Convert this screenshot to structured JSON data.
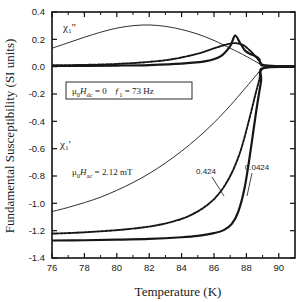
{
  "chart_data": {
    "type": "line",
    "title": "",
    "xlabel": "Temperature (K)",
    "ylabel": "Fundamental Susceptibility (SI units)",
    "xlim": [
      76,
      91
    ],
    "ylim": [
      -1.4,
      0.4
    ],
    "xticks": [
      76,
      78,
      80,
      82,
      84,
      86,
      88,
      90
    ],
    "xticklabels": [
      "76",
      "78",
      "80",
      "82",
      "84",
      "86",
      "88",
      "90"
    ],
    "yticks": [
      -1.4,
      -1.2,
      -1.0,
      -0.8,
      -0.6,
      -0.4,
      -0.2,
      0.0,
      0.2,
      0.4
    ],
    "yticklabels": [
      "-1.4",
      "-1.2",
      "-1.0",
      "-0.8",
      "-0.6",
      "-0.4",
      "-0.2",
      "0.0",
      "0.2",
      "0.4"
    ],
    "grid": false,
    "legend": "none",
    "series": [
      {
        "name": "chi1-imag-thin",
        "quantity": "chi_1''",
        "style": "thin-solid",
        "x": [
          76,
          77,
          78,
          79,
          80,
          81,
          82,
          83,
          84,
          85,
          86,
          87,
          87.6,
          88.2,
          88.6,
          88.9,
          89.1,
          91
        ],
        "y": [
          0.135,
          0.175,
          0.215,
          0.252,
          0.282,
          0.3,
          0.305,
          0.295,
          0.272,
          0.238,
          0.192,
          0.135,
          0.1,
          0.062,
          0.035,
          0.014,
          0.004,
          0.002
        ]
      },
      {
        "name": "chi1-imag-dashed",
        "quantity": "chi_1''",
        "style": "dashed",
        "x": [
          76,
          78,
          80,
          82,
          83.5,
          85,
          86,
          86.8,
          87.3,
          87.8,
          88.2,
          88.6,
          88.9,
          89.1,
          91
        ],
        "y": [
          0.01,
          0.013,
          0.02,
          0.035,
          0.056,
          0.095,
          0.134,
          0.163,
          0.172,
          0.158,
          0.12,
          0.07,
          0.028,
          0.008,
          0.003
        ]
      },
      {
        "name": "chi1-imag-thick",
        "quantity": "chi_1''",
        "style": "thick-solid",
        "x": [
          76,
          78,
          80,
          82,
          84,
          85.5,
          86.4,
          87.0,
          87.3,
          87.6,
          87.9,
          88.2,
          88.5,
          88.8,
          89.05,
          91
        ],
        "y": [
          0.005,
          0.006,
          0.008,
          0.012,
          0.022,
          0.04,
          0.075,
          0.15,
          0.228,
          0.175,
          0.12,
          0.095,
          0.08,
          0.055,
          0.012,
          0.002
        ]
      },
      {
        "name": "chi1-real-thin",
        "quantity": "chi_1'",
        "style": "thin-solid",
        "x": [
          76,
          77,
          78,
          79,
          80,
          81,
          82,
          83,
          84,
          85,
          86,
          87,
          87.8,
          88.4,
          88.8,
          89.05,
          91
        ],
        "y": [
          -1.06,
          -1.03,
          -0.995,
          -0.955,
          -0.905,
          -0.848,
          -0.782,
          -0.705,
          -0.618,
          -0.52,
          -0.41,
          -0.285,
          -0.175,
          -0.092,
          -0.035,
          -0.008,
          -0.002
        ]
      },
      {
        "name": "chi1-real-dashed",
        "quantity": "chi_1'",
        "style": "dashed",
        "label": "0.424",
        "x": [
          76,
          78,
          80,
          81.5,
          82.5,
          83.5,
          84.5,
          85.5,
          86.3,
          87.0,
          87.6,
          88.1,
          88.5,
          88.8,
          89.05,
          91
        ],
        "y": [
          -1.222,
          -1.212,
          -1.196,
          -1.178,
          -1.16,
          -1.132,
          -1.09,
          -1.02,
          -0.93,
          -0.8,
          -0.63,
          -0.42,
          -0.23,
          -0.095,
          -0.01,
          -0.002
        ]
      },
      {
        "name": "chi1-real-thick",
        "quantity": "chi_1'",
        "style": "thick-solid",
        "label": "0.0424",
        "x": [
          76,
          78,
          80,
          82,
          84,
          85,
          86,
          86.6,
          87.1,
          87.5,
          87.9,
          88.3,
          88.6,
          88.9,
          89.05,
          91
        ],
        "y": [
          -1.272,
          -1.27,
          -1.266,
          -1.26,
          -1.248,
          -1.238,
          -1.218,
          -1.196,
          -1.15,
          -1.06,
          -0.88,
          -0.58,
          -0.33,
          -0.11,
          -0.012,
          -0.002
        ]
      }
    ],
    "annotations": {
      "chi_imag_label": "χ₁''",
      "chi_real_label": "χ₁'",
      "boxed": "μ₀Hᵈᶜ = 0     ƒ₁ = 73 Hz",
      "boxed_parts": {
        "mu": "μ",
        "zero_sub": "0",
        "H": "H",
        "dc_sub": "dc",
        "eq1": "= 0",
        "f": "ƒ",
        "one_sub": "1",
        "eq2": "= 73 Hz"
      },
      "hac": {
        "mu": "μ",
        "zero_sub": "0",
        "H": "H",
        "ac_sub": "ac",
        "value": "= 2.12 mT"
      },
      "curve_label_dashed": "0.424",
      "curve_label_thick": "0.0424"
    },
    "colors": {
      "line": "#161616",
      "axis": "#111111",
      "background": "#ffffff"
    }
  }
}
